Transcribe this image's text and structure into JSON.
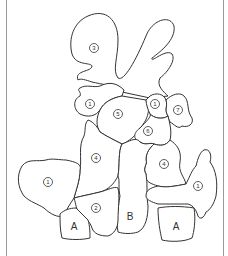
{
  "diagram": {
    "type": "paint-by-number plant illustration",
    "regions": [
      {
        "id": "r3",
        "label": "3",
        "x": 94,
        "y": 48
      },
      {
        "id": "r1a",
        "label": "1",
        "x": 90,
        "y": 104
      },
      {
        "id": "r5",
        "label": "5",
        "x": 118,
        "y": 114
      },
      {
        "id": "r1b",
        "label": "1",
        "x": 155,
        "y": 104
      },
      {
        "id": "r7",
        "label": "7",
        "x": 178,
        "y": 110
      },
      {
        "id": "r6",
        "label": "6",
        "x": 148,
        "y": 131
      },
      {
        "id": "r4a",
        "label": "4",
        "x": 96,
        "y": 158
      },
      {
        "id": "r4b",
        "label": "4",
        "x": 164,
        "y": 164
      },
      {
        "id": "r1c",
        "label": "1",
        "x": 48,
        "y": 182
      },
      {
        "id": "r1d",
        "label": "1",
        "x": 198,
        "y": 186
      },
      {
        "id": "r2",
        "label": "2",
        "x": 96,
        "y": 208
      },
      {
        "id": "rB",
        "label": "B",
        "x": 130,
        "y": 216
      },
      {
        "id": "rA1",
        "label": "A",
        "x": 74,
        "y": 226
      },
      {
        "id": "rA2",
        "label": "A",
        "x": 176,
        "y": 226
      }
    ]
  }
}
